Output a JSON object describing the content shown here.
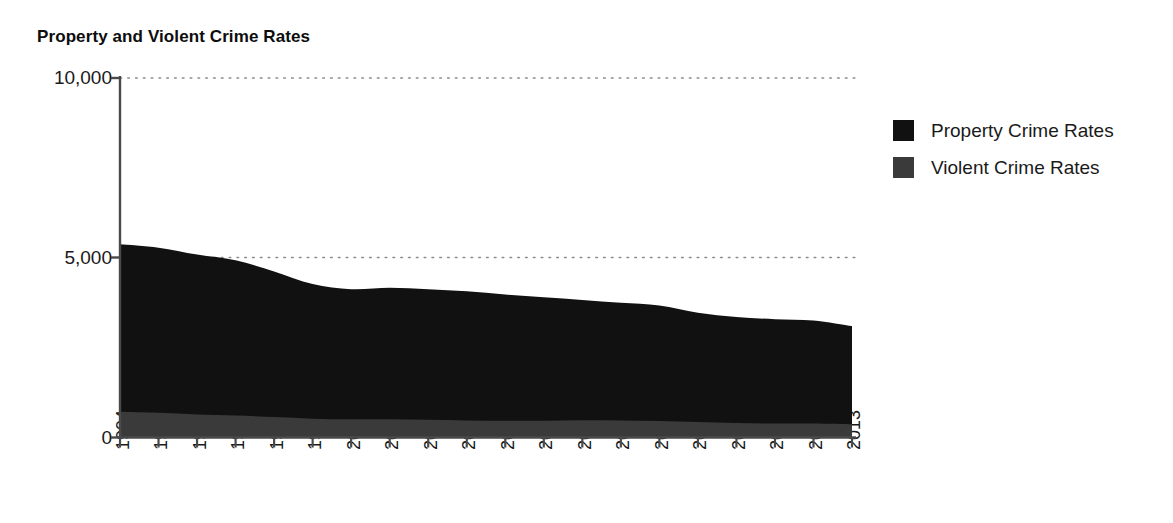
{
  "chart_data": {
    "type": "area",
    "stacked": true,
    "title": "Property and Violent Crime Rates",
    "xlabel": "",
    "ylabel": "",
    "ylim": [
      0,
      10000
    ],
    "yticks": [
      "0",
      "5,000",
      "10,000"
    ],
    "ytick_values": [
      0,
      5000,
      10000
    ],
    "grid": "horizontal dotted gridlines at 5,000 and 10,000",
    "legend_position": "right",
    "categories": [
      "1994",
      "1995",
      "1996",
      "1997",
      "1998",
      "1999",
      "2000",
      "2001",
      "2002",
      "2003",
      "2004",
      "2005",
      "2006",
      "2007",
      "2008",
      "2009",
      "2010",
      "2011",
      "2012",
      "2013"
    ],
    "series": [
      {
        "name": "Violent Crime Rates",
        "color": "#3a3a3a",
        "values": [
          714,
          685,
          637,
          611,
          568,
          523,
          507,
          505,
          494,
          476,
          463,
          469,
          479,
          472,
          458,
          432,
          405,
          387,
          387,
          368
        ]
      },
      {
        "name": "Property Crime Rates",
        "color": "#111111",
        "values": [
          4660,
          4595,
          4450,
          4316,
          4052,
          3744,
          3618,
          3658,
          3631,
          3591,
          3514,
          3432,
          3346,
          3276,
          3215,
          3041,
          2946,
          2905,
          2868,
          2731
        ]
      }
    ],
    "stack_totals": [
      5374,
      5280,
      5087,
      4927,
      4620,
      4267,
      4125,
      4163,
      4125,
      4067,
      3977,
      3901,
      3825,
      3748,
      3673,
      3473,
      3351,
      3292,
      3255,
      3099
    ]
  },
  "legend": {
    "items": [
      {
        "label": "Property Crime Rates",
        "color": "#111111"
      },
      {
        "label": "Violent Crime Rates",
        "color": "#3a3a3a"
      }
    ]
  },
  "axes": {
    "y_tick_labels": [
      "10,000",
      "5,000",
      "0"
    ],
    "x_tick_labels": [
      "1994",
      "1995",
      "1996",
      "1997",
      "1998",
      "1999",
      "2000",
      "2001",
      "2002",
      "2003",
      "2004",
      "2005",
      "2006",
      "2007",
      "2008",
      "2009",
      "2010",
      "2011",
      "2012",
      "2013"
    ]
  },
  "colors": {
    "property": "#111111",
    "violent": "#3a3a3a",
    "axis": "#4a4a4a",
    "gridline": "#8c8c8c",
    "text": "#1a1a1a",
    "background": "#ffffff"
  }
}
